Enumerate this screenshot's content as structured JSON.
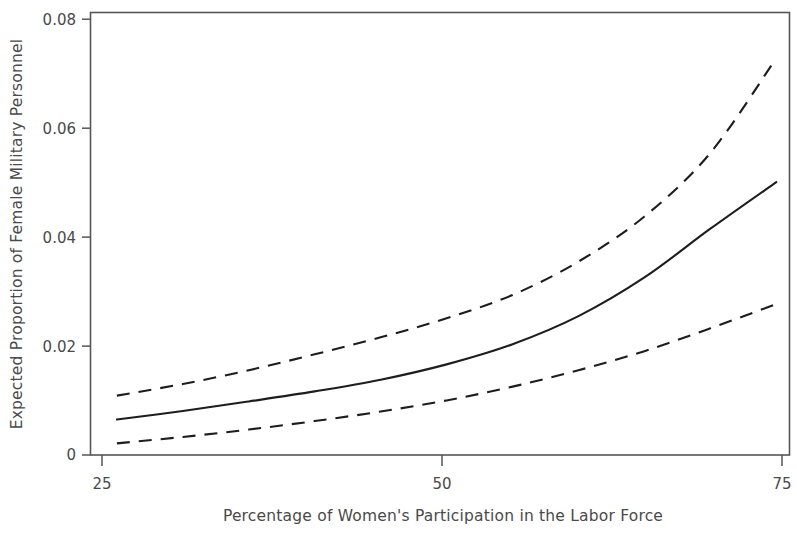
{
  "chart_data": {
    "type": "line",
    "title": "",
    "subtitle": "",
    "xlabel": "Percentage of Women's Participation in the Labor Force",
    "ylabel": "Expected Proportion of Female Military Personnel",
    "xlim": [
      23.0,
      76.0
    ],
    "ylim": [
      0,
      0.0835
    ],
    "xticks": [
      25,
      50,
      75
    ],
    "xtick_labels": [
      "25",
      "50",
      "75"
    ],
    "yticks": [
      0,
      0.02,
      0.04,
      0.06,
      0.08
    ],
    "ytick_labels": [
      "0",
      "0.02",
      "0.04",
      "0.06",
      "0.08"
    ],
    "grid": false,
    "legend": null,
    "legend_position": "none",
    "annotations": [],
    "x": [
      25,
      30,
      35,
      40,
      45,
      50,
      55,
      60,
      65,
      70,
      75
    ],
    "series": [
      {
        "name": "Upper 95% confidence bound",
        "style": "dashed",
        "color": "#1d1d1d",
        "values": [
          0.0112,
          0.0134,
          0.016,
          0.019,
          0.0222,
          0.0258,
          0.0302,
          0.0365,
          0.045,
          0.057,
          0.0749
        ]
      },
      {
        "name": "Expected proportion (predicted)",
        "style": "solid",
        "color": "#1d1d1d",
        "values": [
          0.0067,
          0.0083,
          0.0101,
          0.012,
          0.0142,
          0.0171,
          0.0209,
          0.0262,
          0.0335,
          0.0427,
          0.0515
        ]
      },
      {
        "name": "Lower 95% confidence bound",
        "style": "dashed",
        "color": "#1d1d1d",
        "values": [
          0.0022,
          0.0034,
          0.0048,
          0.0064,
          0.0082,
          0.0103,
          0.0129,
          0.016,
          0.0196,
          0.0239,
          0.0285
        ]
      }
    ]
  },
  "axes": {
    "x_title": "Percentage of Women's Participation in the Labor Force",
    "y_title": "Expected Proportion of Female Military Personnel",
    "x_tick_0": "25",
    "x_tick_1": "50",
    "x_tick_2": "75",
    "y_tick_0": "0",
    "y_tick_1": "0.02",
    "y_tick_2": "0.04",
    "y_tick_3": "0.06",
    "y_tick_4": "0.08"
  },
  "colors": {
    "line": "#1d1d1d",
    "frame": "#56565a",
    "text": "#4a4a4a",
    "background": "#ffffff"
  }
}
